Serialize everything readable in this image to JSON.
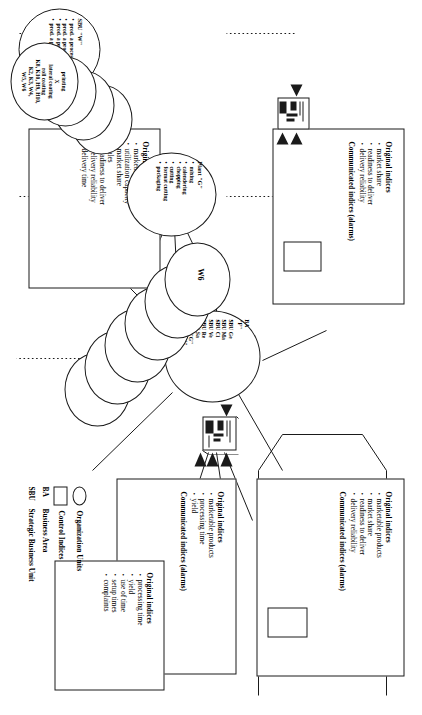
{
  "figure": {
    "orientation": "rotated-90",
    "ink_color": "#1a1a1a",
    "paper_color": "#ffffff"
  },
  "legend": {
    "rows": [
      {
        "symbol": "circle-icon",
        "abbr": "",
        "label": "Organization Units"
      },
      {
        "symbol": "rectangle-icon",
        "abbr": "",
        "label": "Control Indices"
      },
      {
        "symbol": "",
        "abbr": "BA",
        "label": "Business Area"
      },
      {
        "symbol": "",
        "abbr": "SBU",
        "label": "Strategic Business Unit"
      }
    ]
  },
  "boxes": {
    "ba_indices": {
      "title": "Original indices",
      "items": [
        "marketable products",
        "market share",
        "readiness to deliver",
        "delivery reliability"
      ],
      "communicated": "Communicated indices (alarms)"
    },
    "plant_indices": {
      "title": "Original indices",
      "items": [
        "marketable products",
        "processing time",
        "yield"
      ],
      "communicated": "Communicated indices (alarms)"
    },
    "cost_center_indices": {
      "title": "Original indices",
      "items": [
        "processing time",
        "yield",
        "use of time",
        "setup times",
        "complaints"
      ],
      "communicated": ""
    },
    "sbu_indices": {
      "title": "Original indices",
      "items": [
        "market share",
        "readiness to deliver",
        "delivery reliability"
      ],
      "communicated": "Communicated indices (alarms)"
    },
    "sbu_detail_indices": {
      "title": "Original indices",
      "items": [
        "marketable products",
        "utilization capacity",
        "market share",
        "sales",
        "readiness to deliver",
        "delivery reliability",
        "delivery time"
      ],
      "communicated": ""
    }
  },
  "ovals": {
    "business_area": {
      "title": "BA",
      "subtitle": "\"F\"",
      "items": [
        "SBU Ge",
        "SBU Ma",
        "SBU Ci",
        "SBU Ve",
        "SBU Re",
        "SBU Sa",
        "Plant \"G\"",
        "Plant \"W\""
      ]
    },
    "plant_g": {
      "title": "Plant \"G\"",
      "items": [
        "mixing",
        "calendering",
        "chopping",
        "cutting",
        "format cutting",
        "packaging"
      ]
    },
    "sbu_w": {
      "title": "SBU \"W\"",
      "items": [
        "prod. a process Ve1",
        "prod. a process Ve2",
        "prod. a process Ve3",
        "prod. a process Ve4"
      ]
    }
  },
  "stacks": {
    "plant_g_cost_centers": {
      "labels": [
        "W6",
        "W5",
        "W4",
        "H17",
        "H10",
        "H9"
      ]
    },
    "sbu_w_processes": {
      "front_lines": [
        "printing",
        "X",
        "lateral coating",
        "roll coating",
        "K8, K10, H9, H10,",
        "K2, K3, W4,",
        "W5, W6"
      ]
    }
  }
}
